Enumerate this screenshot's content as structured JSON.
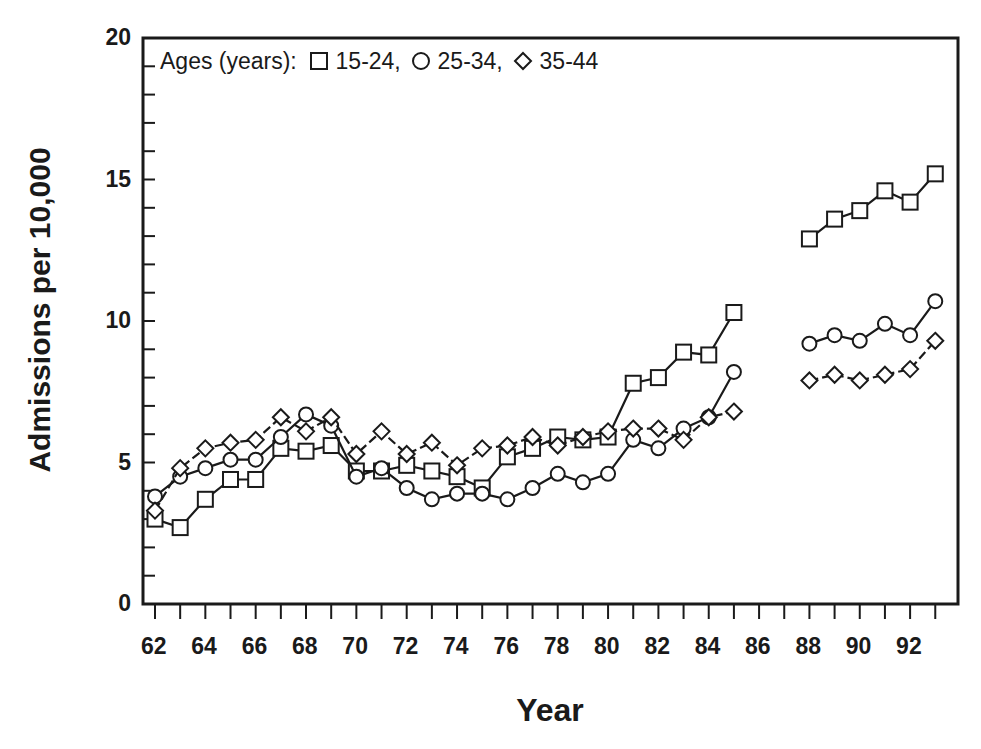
{
  "chart_data": {
    "type": "line",
    "title": "",
    "xlabel": "Year",
    "ylabel": "Admissions per 10,000",
    "ylim": [
      0,
      20
    ],
    "yticks": [
      0,
      5,
      10,
      15,
      20
    ],
    "y_minor_step": 1,
    "xlim": [
      61.5,
      94
    ],
    "xticks_labeled": [
      "62",
      "64",
      "66",
      "68",
      "70",
      "72",
      "74",
      "76",
      "78",
      "80",
      "82",
      "84",
      "86",
      "88",
      "90",
      "92"
    ],
    "x_minor_step": 1,
    "grid": false,
    "legend": {
      "position": "top-left inside",
      "prefix": "Ages (years):",
      "entries": [
        {
          "marker": "square",
          "label": "15-24,"
        },
        {
          "marker": "circle",
          "label": "25-34,"
        },
        {
          "marker": "diamond",
          "label": "35-44"
        }
      ]
    },
    "segments_note": "Gap between 1985 and 1988 (no data for 86-87)",
    "series": [
      {
        "name": "15-24",
        "marker": "square",
        "line": "solid",
        "x": [
          62,
          63,
          64,
          65,
          66,
          67,
          68,
          69,
          70,
          71,
          72,
          73,
          74,
          75,
          76,
          77,
          78,
          79,
          80,
          81,
          82,
          83,
          84,
          85,
          88,
          89,
          90,
          91,
          92,
          93
        ],
        "values": [
          3.0,
          2.7,
          3.7,
          4.4,
          4.4,
          5.5,
          5.4,
          5.6,
          4.7,
          4.7,
          4.9,
          4.7,
          4.5,
          4.1,
          5.2,
          5.5,
          5.9,
          5.8,
          5.9,
          7.8,
          8.0,
          8.9,
          8.8,
          10.3,
          12.9,
          13.6,
          13.9,
          14.6,
          14.2,
          15.2
        ]
      },
      {
        "name": "25-34",
        "marker": "circle",
        "line": "solid",
        "x": [
          62,
          63,
          64,
          65,
          66,
          67,
          68,
          69,
          70,
          71,
          72,
          73,
          74,
          75,
          76,
          77,
          78,
          79,
          80,
          81,
          82,
          83,
          84,
          85,
          88,
          89,
          90,
          91,
          92,
          93
        ],
        "values": [
          3.8,
          4.5,
          4.8,
          5.1,
          5.1,
          5.9,
          6.7,
          6.3,
          4.5,
          4.8,
          4.1,
          3.7,
          3.9,
          3.9,
          3.7,
          4.1,
          4.6,
          4.3,
          4.6,
          5.8,
          5.5,
          6.2,
          6.6,
          8.2,
          9.2,
          9.5,
          9.3,
          9.9,
          9.5,
          10.7
        ]
      },
      {
        "name": "35-44",
        "marker": "diamond",
        "line": "dashed",
        "x": [
          62,
          63,
          64,
          65,
          66,
          67,
          68,
          69,
          70,
          71,
          72,
          73,
          74,
          75,
          76,
          77,
          78,
          79,
          80,
          81,
          82,
          83,
          84,
          85,
          88,
          89,
          90,
          91,
          92,
          93
        ],
        "values": [
          3.3,
          4.8,
          5.5,
          5.7,
          5.8,
          6.6,
          6.1,
          6.6,
          5.3,
          6.1,
          5.3,
          5.7,
          4.9,
          5.5,
          5.6,
          5.9,
          5.6,
          5.9,
          6.1,
          6.2,
          6.2,
          5.8,
          6.6,
          6.8,
          7.9,
          8.1,
          7.9,
          8.1,
          8.3,
          9.3
        ]
      }
    ]
  },
  "colors": {
    "ink": "#1a1a1a",
    "background": "#ffffff"
  }
}
